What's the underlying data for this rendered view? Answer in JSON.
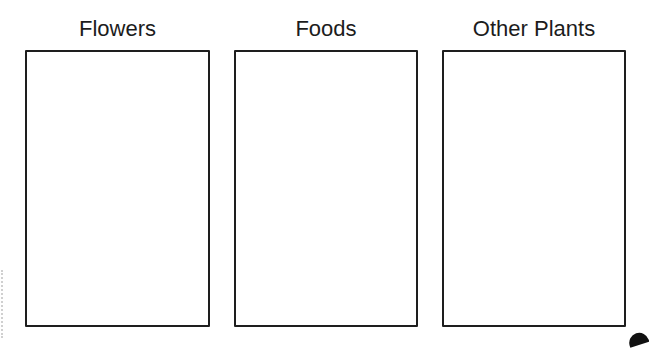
{
  "worksheet": {
    "columns": [
      {
        "title": "Flowers"
      },
      {
        "title": "Foods"
      },
      {
        "title": "Other Plants"
      }
    ]
  }
}
